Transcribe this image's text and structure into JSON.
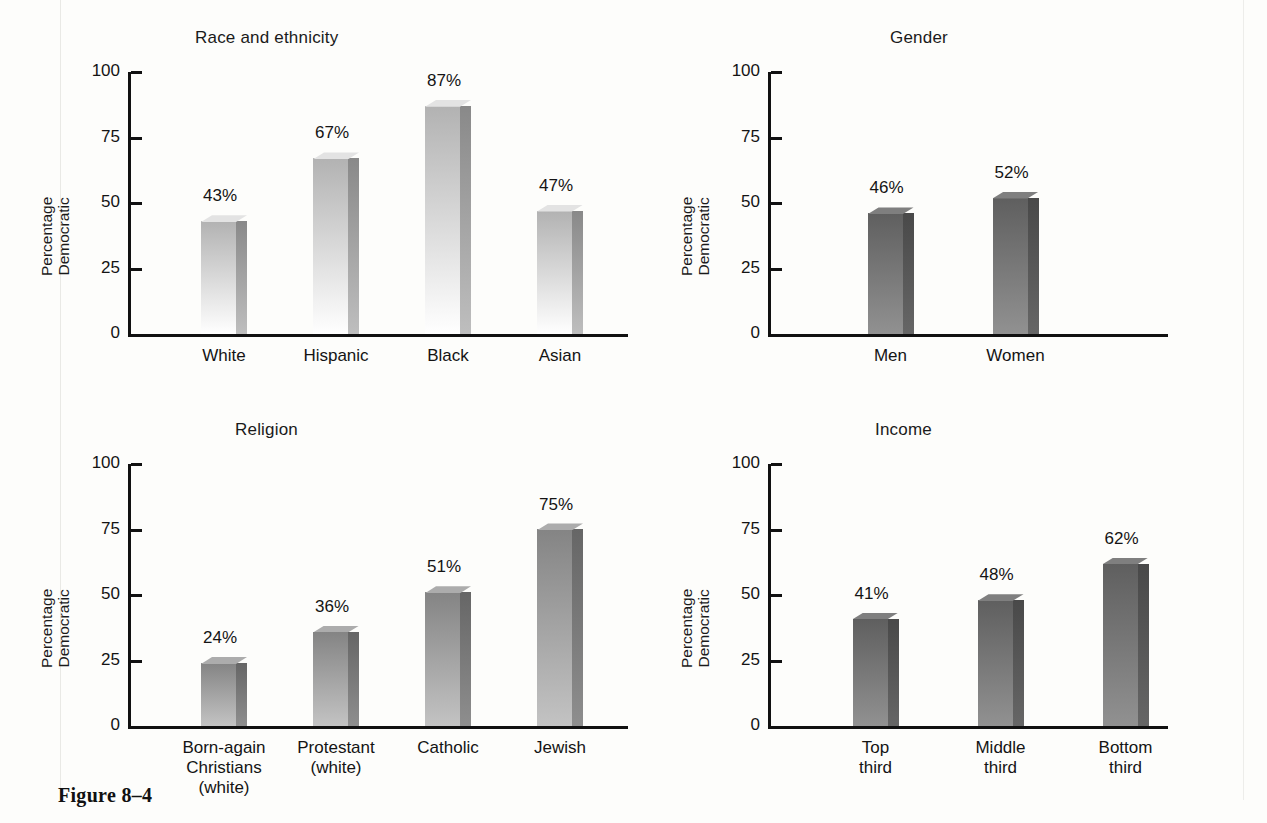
{
  "figure": {
    "caption": "Figure 8–4",
    "axis_label_line1": "Percentage",
    "axis_label_line2": "Democratic"
  },
  "chart_data": [
    {
      "type": "bar",
      "title": "Race and ethnicity",
      "xlabel": "",
      "ylabel": "Percentage Democratic",
      "ylim": [
        0,
        100
      ],
      "yticks": [
        0,
        25,
        50,
        75,
        100
      ],
      "grid": false,
      "legend": "none",
      "bar_color": "#cfcfcf",
      "categories": [
        "White",
        "Hispanic",
        "Black",
        "Asian"
      ],
      "values": [
        43,
        67,
        87,
        47
      ],
      "value_labels": [
        "43%",
        "67%",
        "87%",
        "47%"
      ]
    },
    {
      "type": "bar",
      "title": "Gender",
      "xlabel": "",
      "ylabel": "Percentage Democratic",
      "ylim": [
        0,
        100
      ],
      "yticks": [
        0,
        25,
        50,
        75,
        100
      ],
      "grid": false,
      "legend": "none",
      "bar_color": "#6f6f6f",
      "categories": [
        "Men",
        "Women"
      ],
      "values": [
        46,
        52
      ],
      "value_labels": [
        "46%",
        "52%"
      ]
    },
    {
      "type": "bar",
      "title": "Religion",
      "xlabel": "",
      "ylabel": "Percentage Democratic",
      "ylim": [
        0,
        100
      ],
      "yticks": [
        0,
        25,
        50,
        75,
        100
      ],
      "grid": false,
      "legend": "none",
      "bar_color": "#9a9a9a",
      "categories": [
        "Born-again\nChristians\n(white)",
        "Protestant\n(white)",
        "Catholic",
        "Jewish"
      ],
      "values": [
        24,
        36,
        51,
        75
      ],
      "value_labels": [
        "24%",
        "36%",
        "51%",
        "75%"
      ]
    },
    {
      "type": "bar",
      "title": "Income",
      "xlabel": "",
      "ylabel": "Percentage Democratic",
      "ylim": [
        0,
        100
      ],
      "yticks": [
        0,
        25,
        50,
        75,
        100
      ],
      "grid": false,
      "legend": "none",
      "bar_color": "#6f6f6f",
      "categories": [
        "Top\nthird",
        "Middle\nthird",
        "Bottom\nthird"
      ],
      "values": [
        41,
        48,
        62
      ],
      "value_labels": [
        "41%",
        "48%",
        "62%"
      ]
    }
  ],
  "panel_geometry": [
    {
      "left": 20,
      "top": 28,
      "plot_left": 108,
      "plot_top": 44,
      "plot_w": 500,
      "plot_h": 262,
      "title_left": 175,
      "bar_w": 46,
      "slot_w": 112,
      "slot_start": 40
    },
    {
      "left": 660,
      "top": 28,
      "plot_left": 108,
      "plot_top": 44,
      "plot_w": 400,
      "plot_h": 262,
      "title_left": 230,
      "bar_w": 46,
      "slot_w": 125,
      "slot_start": 60
    },
    {
      "left": 20,
      "top": 420,
      "plot_left": 108,
      "plot_top": 44,
      "plot_w": 500,
      "plot_h": 262,
      "title_left": 215,
      "bar_w": 46,
      "slot_w": 112,
      "slot_start": 40
    },
    {
      "left": 660,
      "top": 420,
      "plot_left": 108,
      "plot_top": 44,
      "plot_w": 400,
      "plot_h": 262,
      "title_left": 215,
      "bar_w": 46,
      "slot_w": 125,
      "slot_start": 45
    }
  ]
}
